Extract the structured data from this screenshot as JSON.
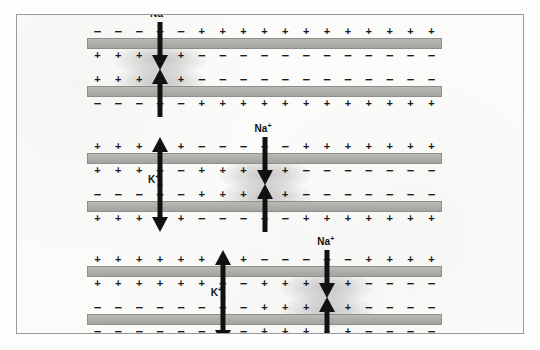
{
  "figure": {
    "background_color": "#fbfbfa",
    "border_color": "#9a9a9a",
    "membrane_color": "#aeaeaa",
    "charge_plus": "+",
    "charge_minus": "−",
    "columns": 17
  },
  "labels": {
    "sodium": "Na",
    "potassium": "K",
    "charge_superscript": "+"
  },
  "panels": [
    {
      "id": "panel-1",
      "name": "stage-1-initial-depolarization",
      "top": 0,
      "membranes": [
        {
          "id": "panel-1-membrane-1",
          "upper": [
            "-",
            "-",
            "-",
            "-",
            "-",
            "+",
            "+",
            "+",
            "+",
            "+",
            "+",
            "+",
            "+",
            "+",
            "+",
            "+",
            "+"
          ],
          "lower": [
            "+",
            "+",
            "+",
            "+",
            "+",
            "-",
            "-",
            "-",
            "-",
            "-",
            "-",
            "-",
            "-",
            "-",
            "-",
            "-",
            "-"
          ]
        },
        {
          "id": "panel-1-membrane-2",
          "upper": [
            "+",
            "+",
            "+",
            "+",
            "+",
            "-",
            "-",
            "-",
            "-",
            "-",
            "-",
            "-",
            "-",
            "-",
            "-",
            "-",
            "-"
          ],
          "lower": [
            "-",
            "-",
            "-",
            "-",
            "-",
            "+",
            "+",
            "+",
            "+",
            "+",
            "+",
            "+",
            "+",
            "+",
            "+",
            "+",
            "+"
          ]
        }
      ],
      "arrows": [
        {
          "name": "sodium-influx-arrow-top",
          "ion": "Na",
          "column": 3,
          "direction": "down",
          "label": true,
          "label_position": "above"
        },
        {
          "name": "sodium-influx-arrow-bottom",
          "ion": "Na",
          "column": 3,
          "direction": "up",
          "label": false
        }
      ],
      "glows": [
        {
          "name": "depolarization-glow-upper",
          "column": 3,
          "band": "upper"
        },
        {
          "name": "depolarization-glow-lower",
          "column": 3,
          "band": "lower"
        }
      ]
    },
    {
      "id": "panel-2",
      "name": "stage-2-propagation-with-potassium-efflux",
      "top": 115,
      "membranes": [
        {
          "id": "panel-2-membrane-1",
          "upper": [
            "+",
            "+",
            "+",
            "+",
            "+",
            "-",
            "-",
            "-",
            "-",
            "-",
            "+",
            "+",
            "+",
            "+",
            "+",
            "+",
            "+"
          ],
          "lower": [
            "+",
            "+",
            "+",
            "-",
            "-",
            "+",
            "+",
            "+",
            "+",
            "+",
            "-",
            "-",
            "-",
            "-",
            "-",
            "-",
            "-"
          ]
        },
        {
          "id": "panel-2-membrane-2",
          "upper": [
            "-",
            "-",
            "-",
            "-",
            "-",
            "+",
            "+",
            "+",
            "+",
            "+",
            "-",
            "-",
            "-",
            "-",
            "-",
            "-",
            "-"
          ],
          "lower": [
            "+",
            "+",
            "+",
            "+",
            "+",
            "-",
            "-",
            "-",
            "-",
            "-",
            "+",
            "+",
            "+",
            "+",
            "+",
            "+",
            "+"
          ]
        }
      ],
      "arrows": [
        {
          "name": "potassium-efflux-arrow-top",
          "ion": "K",
          "column": 3,
          "direction": "up",
          "label": false
        },
        {
          "name": "potassium-efflux-arrow-bottom",
          "ion": "K",
          "column": 3,
          "direction": "down",
          "label": true,
          "label_position": "middle"
        },
        {
          "name": "sodium-influx-arrow-top",
          "ion": "Na",
          "column": 8,
          "direction": "down",
          "label": true,
          "label_position": "above"
        },
        {
          "name": "sodium-influx-arrow-bottom",
          "ion": "Na",
          "column": 8,
          "direction": "up",
          "label": false
        }
      ],
      "glows": [
        {
          "name": "depolarization-glow-upper",
          "column": 8,
          "band": "upper"
        },
        {
          "name": "depolarization-glow-lower",
          "column": 8,
          "band": "lower"
        }
      ]
    },
    {
      "id": "panel-3",
      "name": "stage-3-further-propagation",
      "top": 228,
      "membranes": [
        {
          "id": "panel-3-membrane-1",
          "upper": [
            "+",
            "+",
            "+",
            "+",
            "+",
            "+",
            "+",
            "+",
            "-",
            "-",
            "-",
            "-",
            "-",
            "+",
            "+",
            "+",
            "+"
          ],
          "lower": [
            "+",
            "+",
            "+",
            "+",
            "+",
            "+",
            "-",
            "-",
            "+",
            "+",
            "+",
            "+",
            "+",
            "-",
            "-",
            "-",
            "-"
          ]
        },
        {
          "id": "panel-3-membrane-2",
          "upper": [
            "-",
            "-",
            "-",
            "-",
            "-",
            "-",
            "-",
            "-",
            "+",
            "+",
            "+",
            "+",
            "+",
            "-",
            "-",
            "-",
            "-"
          ],
          "lower": [
            "-",
            "-",
            "-",
            "-",
            "-",
            "-",
            "-",
            "-",
            "+",
            "+",
            "+",
            "+",
            "+",
            "-",
            "-",
            "-",
            "-"
          ]
        }
      ],
      "arrows": [
        {
          "name": "potassium-flux-arrow-top",
          "ion": "K",
          "column": 6,
          "direction": "up",
          "label": false
        },
        {
          "name": "potassium-flux-arrow-bottom",
          "ion": "K",
          "column": 6,
          "direction": "down",
          "label": true,
          "label_position": "middle"
        },
        {
          "name": "sodium-influx-arrow-top",
          "ion": "Na",
          "column": 11,
          "direction": "down",
          "label": true,
          "label_position": "above"
        },
        {
          "name": "sodium-influx-arrow-bottom",
          "ion": "Na",
          "column": 11,
          "direction": "up",
          "label": false
        }
      ],
      "glows": [
        {
          "name": "depolarization-glow-upper",
          "column": 11,
          "band": "upper"
        },
        {
          "name": "depolarization-glow-lower",
          "column": 11,
          "band": "lower"
        }
      ]
    }
  ]
}
